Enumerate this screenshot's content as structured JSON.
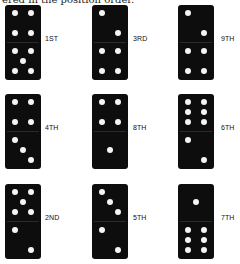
{
  "caption": "ered in the position order.",
  "dominoes": [
    {
      "label": "1ST",
      "top": 4,
      "bottom": 5
    },
    {
      "label": "3RD",
      "top": 2,
      "bottom": 4
    },
    {
      "label": "9TH",
      "top": 2,
      "bottom": 4
    },
    {
      "label": "4TH",
      "top": 4,
      "bottom": 3
    },
    {
      "label": "8TH",
      "top": 4,
      "bottom": 1
    },
    {
      "label": "6TH",
      "top": 6,
      "bottom": 2
    },
    {
      "label": "2ND",
      "top": 5,
      "bottom": 2
    },
    {
      "label": "5TH",
      "top": 3,
      "bottom": 2
    },
    {
      "label": "7TH",
      "top": 1,
      "bottom": 6
    }
  ],
  "colors": {
    "domino": "#0d0d0d",
    "pip": "#f4f4f4"
  }
}
